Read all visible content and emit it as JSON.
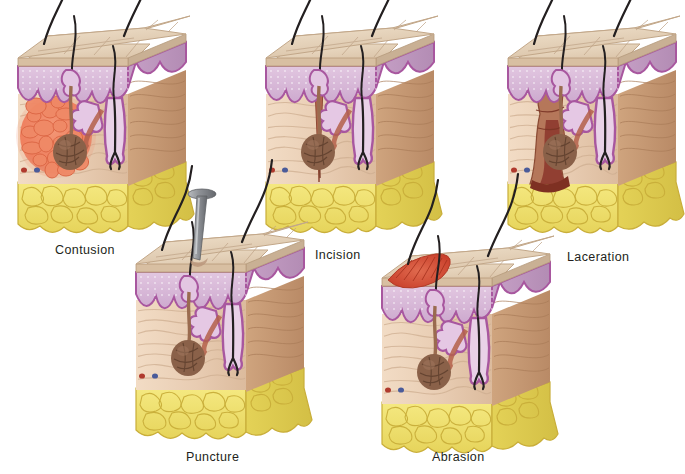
{
  "figure": {
    "background_color": "#ffffff",
    "label_color": "#231f20"
  },
  "palette": {
    "stratum_corneum_top": "#e8d5bd",
    "stratum_corneum_side": "#cdb49a",
    "epidermis": "#d7b8d8",
    "epidermis_line": "#a8579f",
    "dermis_front": "#e9cdb5",
    "dermis_side": "#c79a74",
    "fat_yellow": "#efe06a",
    "fat_outline": "#c9ae3a",
    "hair_black": "#231f20",
    "follicle_brown": "#9a6b4f",
    "sweat_gland": "#8a6149",
    "vessel_red": "#b03a2e",
    "vessel_blue": "#4a5b9a",
    "contusion": "#ef8364",
    "incision_cut": "#b5654d",
    "laceration": "#8e3b2f",
    "abrasion": "#d9533c",
    "nail_metal": "#8e9196"
  },
  "panels": [
    {
      "id": "contusion",
      "label": "Contusion",
      "wound_type": "bruise",
      "wound_description": "Round blotchy reddish-orange mass of pooled blood within the dermis; skin surface intact",
      "wound_color": "#ef8364",
      "has_tool": false,
      "layers": [
        "epidermis",
        "dermis",
        "subcutaneous fat"
      ],
      "features": [
        "hair shaft",
        "hair follicle",
        "sebaceous gland",
        "sweat gland",
        "blood vessels"
      ],
      "x": 10,
      "y": 8,
      "caption_x": 55,
      "caption_y": 243
    },
    {
      "id": "incision",
      "label": "Incision",
      "wound_type": "clean cut",
      "wound_description": "Narrow straight-edged cut extending from the surface through the dermis",
      "wound_color": "#b5654d",
      "has_tool": false,
      "layers": [
        "epidermis",
        "dermis",
        "subcutaneous fat"
      ],
      "features": [
        "hair shaft",
        "hair follicle",
        "sebaceous gland",
        "sweat gland",
        "blood vessels"
      ],
      "x": 258,
      "y": 8,
      "caption_x": 315,
      "caption_y": 248
    },
    {
      "id": "laceration",
      "label": "Laceration",
      "wound_type": "torn wound",
      "wound_description": "Wide irregular jagged tear with ragged edges reaching the subcutaneous layer",
      "wound_color": "#8e3b2f",
      "has_tool": false,
      "layers": [
        "epidermis",
        "dermis",
        "subcutaneous fat"
      ],
      "features": [
        "hair shaft",
        "hair follicle",
        "sebaceous gland",
        "sweat gland",
        "blood vessels"
      ],
      "x": 500,
      "y": 8,
      "caption_x": 567,
      "caption_y": 250
    },
    {
      "id": "puncture",
      "label": "Puncture",
      "wound_type": "penetrating wound",
      "wound_description": "Nail driven through the skin surface leaving a small deep hole",
      "wound_color": "#8e9196",
      "has_tool": true,
      "tool": "nail",
      "layers": [
        "epidermis",
        "dermis",
        "subcutaneous fat"
      ],
      "features": [
        "hair shaft",
        "hair follicle",
        "sebaceous gland",
        "sweat gland",
        "blood vessels"
      ],
      "x": 128,
      "y": 214,
      "caption_x": 186,
      "caption_y": 450
    },
    {
      "id": "abrasion",
      "label": "Abrasion",
      "wound_type": "scrape",
      "wound_description": "Superficial red scraped patch removing only the surface epidermis",
      "wound_color": "#d9533c",
      "has_tool": false,
      "layers": [
        "epidermis",
        "dermis",
        "subcutaneous fat"
      ],
      "features": [
        "hair shaft",
        "hair follicle",
        "sebaceous gland",
        "sweat gland",
        "blood vessels"
      ],
      "x": 374,
      "y": 228,
      "caption_x": 432,
      "caption_y": 450
    }
  ]
}
